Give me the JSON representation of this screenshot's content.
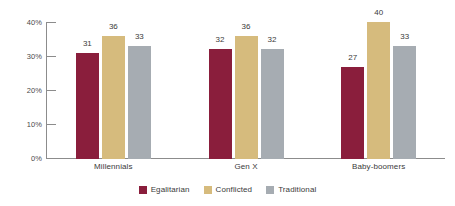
{
  "chart_data": {
    "type": "bar",
    "title": "",
    "subtitle": "",
    "xlabel": "",
    "ylabel": "",
    "categories": [
      "Millennials",
      "Gen X",
      "Baby-boomers"
    ],
    "series": [
      {
        "name": "Egalitarian",
        "color": "#8a1e3c",
        "values": [
          31,
          36,
          27
        ]
      },
      {
        "name": "Conflicted",
        "color": "#d6bb7d",
        "values": [
          36,
          36,
          40
        ]
      },
      {
        "name": "Traditional",
        "color": "#a6acb2",
        "values": [
          33,
          32,
          33
        ]
      }
    ],
    "ylim": [
      0,
      40
    ],
    "y_ticks": [
      0,
      10,
      20,
      30,
      40
    ],
    "y_tick_labels": [
      "0%",
      "10%",
      "20%",
      "30%",
      "40%"
    ],
    "grid": false,
    "legend_position": "bottom",
    "value_labels": true
  },
  "axis": {
    "y": {
      "t0": "0%",
      "t10": "10%",
      "t20": "20%",
      "t30": "30%",
      "t40": "40%"
    }
  },
  "groups": [
    {
      "label": "Millennials",
      "bars": [
        {
          "series": "Egalitarian",
          "value": "31"
        },
        {
          "series": "Conflicted",
          "value": "36"
        },
        {
          "series": "Traditional",
          "value": "33"
        }
      ]
    },
    {
      "label": "Gen X",
      "bars": [
        {
          "series": "Egalitarian",
          "value": "32"
        },
        {
          "series": "Conflicted",
          "value": "36"
        },
        {
          "series": "Traditional",
          "value": "32"
        }
      ]
    },
    {
      "label": "Baby-boomers",
      "bars": [
        {
          "series": "Egalitarian",
          "value": "27"
        },
        {
          "series": "Conflicted",
          "value": "40"
        },
        {
          "series": "Traditional",
          "value": "33"
        }
      ]
    }
  ],
  "legend": {
    "items": [
      {
        "label": "Egalitarian",
        "color": "#8a1e3c"
      },
      {
        "label": "Conflicted",
        "color": "#d6bb7d"
      },
      {
        "label": "Traditional",
        "color": "#a6acb2"
      }
    ]
  }
}
